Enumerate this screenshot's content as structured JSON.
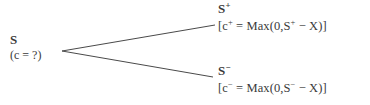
{
  "diagram": {
    "type": "binomial-tree",
    "background_color": "#ffffff",
    "line_color": "#4a4a4a",
    "text_color": "#3a3a3a",
    "root": {
      "symbol": "S",
      "value_label": "(c = ?)"
    },
    "branches": [
      {
        "direction": "up",
        "state_label_base": "S",
        "state_label_sup": "+",
        "payoff": {
          "open_bracket": "[",
          "c_base": "c",
          "c_sup": "+",
          "equals": " = ",
          "func": "Max",
          "open_paren": "(",
          "zero": "0,",
          "s_base": "S",
          "s_sup": "+",
          "minus": " − ",
          "strike": "X",
          "close_paren": ")",
          "close_bracket": "]"
        }
      },
      {
        "direction": "down",
        "state_label_base": "S",
        "state_label_sup": "−",
        "payoff": {
          "open_bracket": "[",
          "c_base": "c",
          "c_sup": "−",
          "equals": " = ",
          "func": "Max",
          "open_paren": "(",
          "zero": "0,",
          "s_base": "S",
          "s_sup": "−",
          "minus": " − ",
          "strike": "X",
          "close_paren": ")",
          "close_bracket": "]"
        }
      }
    ],
    "geometry": {
      "vertex_x": 62,
      "vertex_y": 51,
      "up_end_x": 215,
      "up_end_y": 25,
      "down_end_x": 213,
      "down_end_y": 77,
      "stroke_width": 1.0
    }
  }
}
